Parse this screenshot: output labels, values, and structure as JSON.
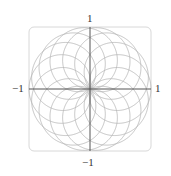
{
  "chart_data": {
    "type": "line",
    "subtype": "polar-rose",
    "title": "",
    "equation": "r = sin(7θ/8), 0 ≤ θ ≤ 16π",
    "petals": 16,
    "xlabel": "",
    "ylabel": "",
    "xlim": [
      -1,
      1
    ],
    "ylim": [
      -1,
      1
    ],
    "x_ticks": [
      "-1",
      "1"
    ],
    "y_ticks": [
      "-1",
      "1"
    ],
    "grid": false,
    "legend": null,
    "frame": "rounded square, light gray",
    "colors": {
      "curve": "#b5b5b5",
      "axes": "#555555",
      "frame": "#d8d8d8",
      "labels": "#333333"
    }
  },
  "labels": {
    "x_min": "−1",
    "x_max": "1",
    "y_min": "−1",
    "y_max": "1"
  }
}
